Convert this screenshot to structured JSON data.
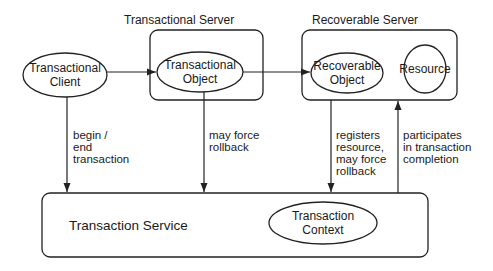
{
  "containers": {
    "transactional_server": {
      "title": "Transactional Server"
    },
    "recoverable_server": {
      "title": "Recoverable Server"
    },
    "transaction_service": {
      "title": "Transaction Service"
    }
  },
  "nodes": {
    "transactional_client": {
      "line1": "Transactional",
      "line2": "Client"
    },
    "transactional_object": {
      "line1": "Transactional",
      "line2": "Object"
    },
    "recoverable_object": {
      "line1": "Recoverable",
      "line2": "Object"
    },
    "resource": {
      "label": "Resource"
    },
    "transaction_context": {
      "line1": "Transaction",
      "line2": "Context"
    }
  },
  "edges": {
    "begin_end": {
      "lines": [
        "begin /",
        "end",
        "transaction"
      ]
    },
    "may_force_rollback": {
      "lines": [
        "may force",
        "rollback"
      ]
    },
    "registers_resource": {
      "lines": [
        "registers",
        "resource,",
        "may force",
        "rollback"
      ]
    },
    "participates": {
      "lines": [
        "participates",
        "in transaction",
        "completion"
      ]
    }
  }
}
